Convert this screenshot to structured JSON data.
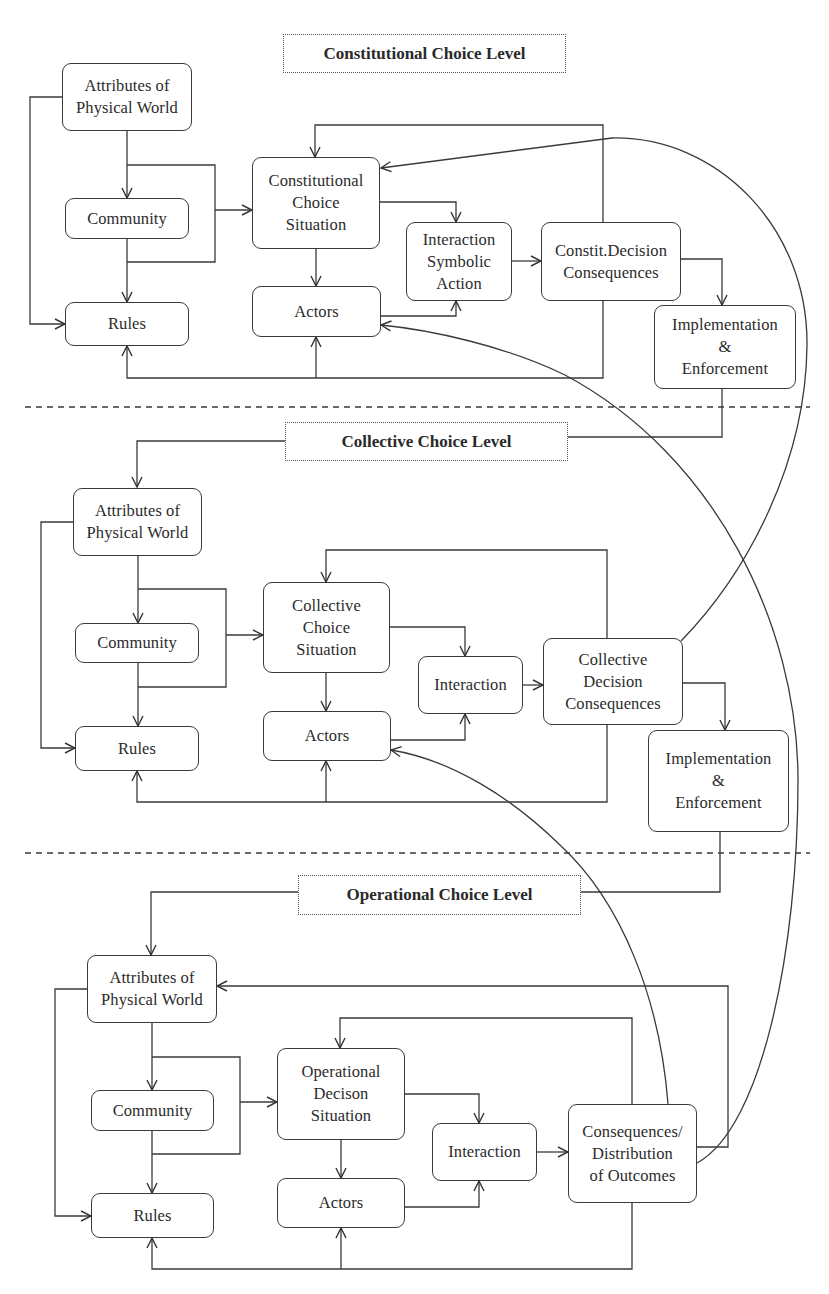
{
  "diagram": {
    "levels": {
      "constitutional": {
        "label": "Constitutional Choice Level",
        "nodes": {
          "attributes": "Attributes of\nPhysical World",
          "community": "Community",
          "rules": "Rules",
          "situation": "Constitutional\nChoice\nSituation",
          "actors": "Actors",
          "interaction": "Interaction\nSymbolic\nAction",
          "consequences": "Constit.Decision\nConsequences",
          "implementation": "Implementation\n&\nEnforcement"
        }
      },
      "collective": {
        "label": "Collective Choice Level",
        "nodes": {
          "attributes": "Attributes of\nPhysical World",
          "community": "Community",
          "rules": "Rules",
          "situation": "Collective\nChoice\nSituation",
          "actors": "Actors",
          "interaction": "Interaction",
          "consequences": "Collective\nDecision\nConsequences",
          "implementation": "Implementation\n&\nEnforcement"
        }
      },
      "operational": {
        "label": "Operational Choice Level",
        "nodes": {
          "attributes": "Attributes of\nPhysical World",
          "community": "Community",
          "rules": "Rules",
          "situation": "Operational\nDecison\nSituation",
          "actors": "Actors",
          "interaction": "Interaction",
          "consequences": "Consequences/\nDistribution\nof Outcomes"
        }
      }
    },
    "edges": [
      {
        "from": "constitutional.attributes",
        "to": "constitutional.community"
      },
      {
        "from": "constitutional.attributes",
        "to": "constitutional.rules"
      },
      {
        "from": "constitutional.attributes",
        "to": "constitutional.situation"
      },
      {
        "from": "constitutional.community",
        "to": "constitutional.situation"
      },
      {
        "from": "constitutional.community",
        "to": "constitutional.rules"
      },
      {
        "from": "constitutional.situation",
        "to": "constitutional.actors"
      },
      {
        "from": "constitutional.situation",
        "to": "constitutional.interaction"
      },
      {
        "from": "constitutional.actors",
        "to": "constitutional.interaction"
      },
      {
        "from": "constitutional.interaction",
        "to": "constitutional.consequences"
      },
      {
        "from": "constitutional.consequences",
        "to": "constitutional.situation"
      },
      {
        "from": "constitutional.consequences",
        "to": "constitutional.rules"
      },
      {
        "from": "constitutional.consequences",
        "to": "constitutional.actors"
      },
      {
        "from": "constitutional.consequences",
        "to": "constitutional.implementation"
      },
      {
        "from": "constitutional.implementation",
        "to": "collective.attributes"
      },
      {
        "from": "collective.attributes",
        "to": "collective.community"
      },
      {
        "from": "collective.attributes",
        "to": "collective.rules"
      },
      {
        "from": "collective.attributes",
        "to": "collective.situation"
      },
      {
        "from": "collective.community",
        "to": "collective.situation"
      },
      {
        "from": "collective.community",
        "to": "collective.rules"
      },
      {
        "from": "collective.situation",
        "to": "collective.actors"
      },
      {
        "from": "collective.situation",
        "to": "collective.interaction"
      },
      {
        "from": "collective.actors",
        "to": "collective.interaction"
      },
      {
        "from": "collective.interaction",
        "to": "collective.consequences"
      },
      {
        "from": "collective.consequences",
        "to": "collective.situation"
      },
      {
        "from": "collective.consequences",
        "to": "collective.rules"
      },
      {
        "from": "collective.consequences",
        "to": "collective.actors"
      },
      {
        "from": "collective.consequences",
        "to": "collective.implementation"
      },
      {
        "from": "collective.consequences",
        "to": "constitutional.situation"
      },
      {
        "from": "collective.implementation",
        "to": "operational.attributes"
      },
      {
        "from": "operational.attributes",
        "to": "operational.community"
      },
      {
        "from": "operational.attributes",
        "to": "operational.rules"
      },
      {
        "from": "operational.attributes",
        "to": "operational.situation"
      },
      {
        "from": "operational.community",
        "to": "operational.situation"
      },
      {
        "from": "operational.community",
        "to": "operational.rules"
      },
      {
        "from": "operational.situation",
        "to": "operational.actors"
      },
      {
        "from": "operational.situation",
        "to": "operational.interaction"
      },
      {
        "from": "operational.actors",
        "to": "operational.interaction"
      },
      {
        "from": "operational.interaction",
        "to": "operational.consequences"
      },
      {
        "from": "operational.consequences",
        "to": "operational.situation"
      },
      {
        "from": "operational.consequences",
        "to": "operational.rules"
      },
      {
        "from": "operational.consequences",
        "to": "operational.actors"
      },
      {
        "from": "operational.consequences",
        "to": "operational.attributes"
      },
      {
        "from": "operational.consequences",
        "to": "collective.actors"
      },
      {
        "from": "operational.consequences",
        "to": "constitutional.actors"
      }
    ]
  }
}
